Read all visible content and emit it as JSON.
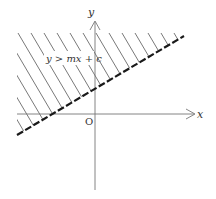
{
  "figure": {
    "type": "inequality-region-diagram",
    "axes": {
      "x_label": "x",
      "y_label": "y",
      "origin_label": "O"
    },
    "boundary": {
      "equation": "y = mx + c",
      "style": "dashed",
      "color": "#1a1a1a"
    },
    "region": {
      "label": "y > mx + c",
      "fill": "hatched",
      "side": "above"
    },
    "colors": {
      "axis": "#777777",
      "hatch": "#555555",
      "text": "#333333",
      "background": "#ffffff"
    }
  }
}
